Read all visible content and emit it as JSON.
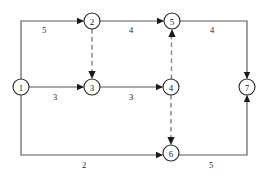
{
  "diagram": {
    "type": "directed-network-graph",
    "title": "",
    "canvas": {
      "width": 272,
      "height": 176,
      "background": "#ffffff"
    },
    "style": {
      "node_fill": "#ffffff",
      "node_stroke": "#262626",
      "solid_edge_color": "#595959",
      "dashed_edge_color": "#808080",
      "arrow_color": "#1a1a1a",
      "label_color": "#1a1a1a"
    },
    "nodes": [
      {
        "id": "1",
        "label": "1",
        "x": 21,
        "y": 87,
        "r": 8
      },
      {
        "id": "2",
        "label": "2",
        "x": 92,
        "y": 21,
        "r": 8
      },
      {
        "id": "3",
        "label": "3",
        "x": 92,
        "y": 87,
        "r": 8
      },
      {
        "id": "4",
        "label": "4",
        "x": 171,
        "y": 87,
        "r": 8
      },
      {
        "id": "5",
        "label": "5",
        "x": 172,
        "y": 21,
        "r": 8
      },
      {
        "id": "6",
        "label": "6",
        "x": 171,
        "y": 153,
        "r": 8
      },
      {
        "id": "7",
        "label": "7",
        "x": 247,
        "y": 87,
        "r": 8
      }
    ],
    "edges": [
      {
        "id": "e-1-2",
        "from": "1",
        "to": "2",
        "style": "solid",
        "weight": "5",
        "label_x": 44,
        "label_y": 30
      },
      {
        "id": "e-2-5",
        "from": "2",
        "to": "5",
        "style": "solid",
        "weight": "4",
        "label_x": 131,
        "label_y": 30
      },
      {
        "id": "e-5-7",
        "from": "5",
        "to": "7",
        "style": "solid",
        "weight": "4",
        "label_x": 212,
        "label_y": 30
      },
      {
        "id": "e-1-3",
        "from": "1",
        "to": "3",
        "style": "solid",
        "weight": "3",
        "label_x": 55,
        "label_y": 97
      },
      {
        "id": "e-3-4",
        "from": "3",
        "to": "4",
        "style": "solid",
        "weight": "3",
        "label_x": 131,
        "label_y": 97
      },
      {
        "id": "e-1-6",
        "from": "1",
        "to": "6",
        "style": "solid",
        "weight": "2",
        "label_x": 84,
        "label_y": 165
      },
      {
        "id": "e-6-7",
        "from": "6",
        "to": "7",
        "style": "solid",
        "weight": "5",
        "label_x": 211,
        "label_y": 165
      },
      {
        "id": "e-2-3",
        "from": "2",
        "to": "3",
        "style": "dashed",
        "weight": "",
        "label_x": 0,
        "label_y": 0
      },
      {
        "id": "e-4-5",
        "from": "4",
        "to": "5",
        "style": "dashed",
        "weight": "",
        "label_x": 0,
        "label_y": 0
      },
      {
        "id": "e-4-6",
        "from": "4",
        "to": "6",
        "style": "dashed",
        "weight": "",
        "label_x": 0,
        "label_y": 0
      }
    ]
  }
}
